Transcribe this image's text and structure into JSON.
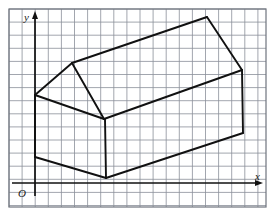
{
  "figure": {
    "background_color": "#ffffff",
    "grid": {
      "visible": true,
      "cell_size_px": 13.1,
      "line_color": "#8a8f99",
      "line_width_px": 0.8,
      "columns": 19,
      "rows": 15,
      "frame": {
        "x": 9,
        "y": 9,
        "width": 257,
        "height": 198,
        "border_color": "#6f747e"
      }
    },
    "axes": {
      "color": "#111111",
      "line_width_px": 1.6,
      "x_axis": {
        "label": "x",
        "label_x": 257,
        "label_y": 180,
        "y_position": 183,
        "x_start": 35,
        "x_end": 262,
        "arrow": "right"
      },
      "y_axis": {
        "label": "y",
        "label_x": 24,
        "label_y": 21,
        "x_position": 35,
        "y_start": 196,
        "y_end": 13,
        "arrow": "up"
      },
      "origin": {
        "label": "O",
        "label_x": 19,
        "label_y": 196
      }
    },
    "shape": {
      "name": "house-prism",
      "stroke_color": "#111111",
      "stroke_width_px": 1.9,
      "fill": "none",
      "vertices": {
        "near_gable_peak": [
          72,
          63
        ],
        "near_eave_left": [
          35,
          95
        ],
        "near_eave_right": [
          104,
          119
        ],
        "near_base_left": [
          35,
          157
        ],
        "near_base_right": [
          106,
          178
        ],
        "far_gable_peak": [
          207,
          17
        ],
        "far_eave_right": [
          242,
          70
        ],
        "far_base_right": [
          243,
          133
        ]
      },
      "edges": [
        {
          "name": "ridge-line",
          "from": "near_gable_peak",
          "to": "far_gable_peak"
        },
        {
          "name": "far-roof-slope",
          "from": "far_gable_peak",
          "to": "far_eave_right"
        },
        {
          "name": "near-roof-slope-left",
          "from": "near_gable_peak",
          "to": "near_eave_left"
        },
        {
          "name": "near-roof-slope-right",
          "from": "near_gable_peak",
          "to": "near_eave_right"
        },
        {
          "name": "right-eave-line",
          "from": "near_eave_right",
          "to": "far_eave_right"
        },
        {
          "name": "left-wall-vertical",
          "from": "near_eave_left",
          "to": "near_base_left"
        },
        {
          "name": "front-wall-vertical",
          "from": "near_eave_right",
          "to": "near_base_right"
        },
        {
          "name": "right-wall-vertical",
          "from": "far_eave_right",
          "to": "far_base_right"
        },
        {
          "name": "left-base-line",
          "from": "near_base_left",
          "to": "near_base_right"
        },
        {
          "name": "right-base-line",
          "from": "near_base_right",
          "to": "far_base_right"
        },
        {
          "name": "gable-base-line",
          "from": "near_eave_left",
          "to": "near_eave_right"
        }
      ]
    }
  }
}
